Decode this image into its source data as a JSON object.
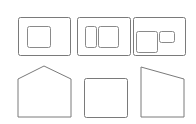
{
  "colors": {
    "background": "#ffffff",
    "outline": "#7a7a7a",
    "inner_outline": "#8a8a8a"
  },
  "layout_options": [
    {
      "name": "layout-single-frame",
      "outer": {
        "x": 18,
        "y": 17,
        "w": 52,
        "h": 38,
        "r": 2
      },
      "inner": [
        {
          "x": 27,
          "y": 26,
          "w": 23,
          "h": 21,
          "r": 2
        }
      ]
    },
    {
      "name": "layout-two-frames",
      "outer": {
        "x": 77,
        "y": 17,
        "w": 53,
        "h": 38,
        "r": 2
      },
      "inner": [
        {
          "x": 85,
          "y": 26,
          "w": 11,
          "h": 21,
          "r": 2
        },
        {
          "x": 98,
          "y": 26,
          "w": 20,
          "h": 21,
          "r": 2
        }
      ]
    },
    {
      "name": "layout-frame-plus-small",
      "outer": {
        "x": 133,
        "y": 17,
        "w": 52,
        "h": 38,
        "r": 2
      },
      "inner": [
        {
          "x": 136,
          "y": 31,
          "w": 21,
          "h": 21,
          "r": 2
        },
        {
          "x": 159,
          "y": 31,
          "w": 15,
          "h": 11,
          "r": 2
        }
      ]
    }
  ],
  "shape_options": [
    {
      "name": "shape-gable",
      "points": "18,79 44,66 71,79 71,117 18,117"
    },
    {
      "name": "shape-flat",
      "rect": {
        "x": 84,
        "y": 78,
        "w": 43,
        "h": 39,
        "r": 2
      }
    },
    {
      "name": "shape-shed",
      "points": "141,67 184,79 184,117 141,117"
    }
  ]
}
